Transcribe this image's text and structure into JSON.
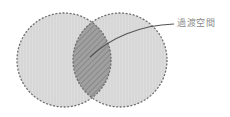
{
  "diagram": {
    "type": "venn",
    "circles": [
      {
        "id": "left",
        "cx": 64,
        "cy": 60,
        "r": 47
      },
      {
        "id": "right",
        "cx": 120,
        "cy": 60,
        "r": 47
      }
    ],
    "intersection_label": "過渡空間",
    "colors": {
      "circle_fill": "#dcdcdc",
      "circle_stroke": "#6e6e6e",
      "intersection_fill": "#9a9a9a",
      "hatch": "#808080",
      "leader_line": "#555555",
      "label_text": "#8a8a8a"
    }
  }
}
